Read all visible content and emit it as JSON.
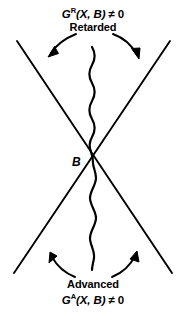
{
  "figure": {
    "background_color": "#ffffff",
    "ink_color": "#000000",
    "width": 186,
    "height": 312
  },
  "top": {
    "formula_symbol": "G",
    "formula_superscript": "R",
    "formula_arguments": "(X, B)",
    "formula_relation": " ≠ 0",
    "region_label": "Retarded"
  },
  "bottom": {
    "region_label": "Advanced",
    "formula_symbol": "G",
    "formula_superscript": "A",
    "formula_arguments": "(X, B)",
    "formula_relation": " ≠ 0"
  },
  "vertex": {
    "label": "B"
  },
  "diagram_elements": {
    "light_cone": "x-shaped-crossing-lines",
    "propagator": "vertical-wavy-line",
    "arrows": [
      "top-left-curved-arrow",
      "top-right-curved-arrow",
      "bottom-left-curved-arrow",
      "bottom-right-curved-arrow"
    ]
  }
}
